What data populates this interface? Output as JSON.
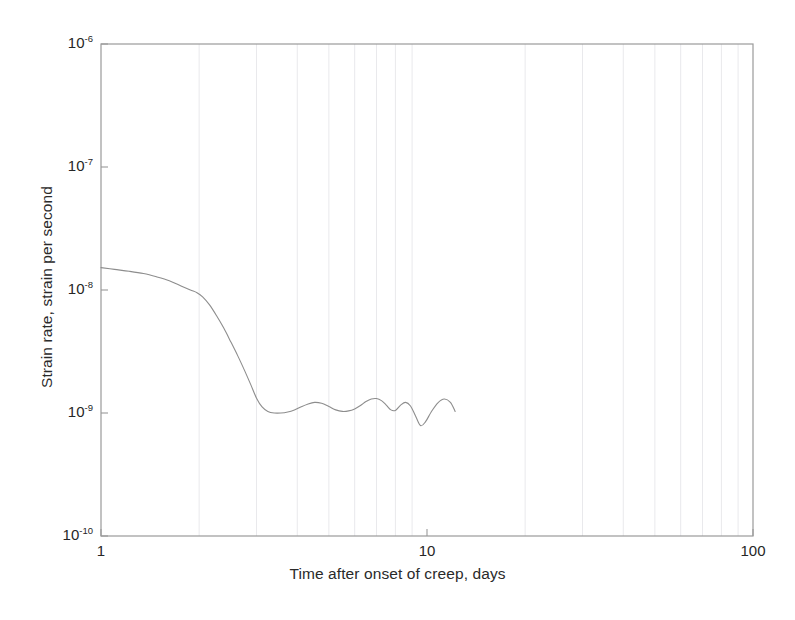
{
  "chart_data": {
    "type": "line",
    "title": "",
    "xlabel": "Time after onset of creep, days",
    "ylabel": "Strain rate, strain per second",
    "xscale": "log",
    "yscale": "log",
    "xlim": [
      1,
      100
    ],
    "ylim": [
      1e-10,
      1e-06
    ],
    "grid": true,
    "grid_axis": "x-minor",
    "legend": "none",
    "xticks": [
      {
        "value": 1,
        "label": "1"
      },
      {
        "value": 10,
        "label": "10"
      },
      {
        "value": 100,
        "label": "100"
      }
    ],
    "yticks": [
      {
        "value": 1e-06,
        "mantissa": "10",
        "exponent": "-6"
      },
      {
        "value": 1e-07,
        "mantissa": "10",
        "exponent": "-7"
      },
      {
        "value": 1e-08,
        "mantissa": "10",
        "exponent": "-8"
      },
      {
        "value": 1e-09,
        "mantissa": "10",
        "exponent": "-9"
      },
      {
        "value": 1e-10,
        "mantissa": "10",
        "exponent": "-10"
      }
    ],
    "series": [
      {
        "name": "strain rate",
        "color": "#8d8d8d",
        "linewidth": 1.1,
        "x": [
          1.0,
          1.1,
          1.22,
          1.35,
          1.48,
          1.62,
          1.76,
          1.88,
          1.97,
          2.05,
          2.15,
          2.26,
          2.38,
          2.5,
          2.63,
          2.76,
          2.88,
          3.0,
          3.12,
          3.25,
          3.4,
          3.56,
          3.74,
          3.92,
          4.1,
          4.3,
          4.52,
          4.75,
          5.0,
          5.25,
          5.5,
          5.75,
          6.0,
          6.25,
          6.5,
          6.75,
          7.0,
          7.25,
          7.5,
          7.75,
          8.0,
          8.3,
          8.6,
          8.9,
          9.2,
          9.55,
          9.9,
          10.3,
          10.8,
          11.3,
          11.8,
          12.2
        ],
        "y": [
          1.52e-08,
          1.47e-08,
          1.42e-08,
          1.36e-08,
          1.28e-08,
          1.19e-08,
          1.08e-08,
          1e-08,
          9.5e-09,
          8.8e-09,
          7.6e-09,
          6.2e-09,
          4.9e-09,
          3.8e-09,
          2.9e-09,
          2.2e-09,
          1.7e-09,
          1.32e-09,
          1.12e-09,
          1.03e-09,
          1e-09,
          1e-09,
          1.02e-09,
          1.06e-09,
          1.12e-09,
          1.18e-09,
          1.22e-09,
          1.2e-09,
          1.13e-09,
          1.06e-09,
          1.03e-09,
          1.04e-09,
          1.08e-09,
          1.15e-09,
          1.24e-09,
          1.3e-09,
          1.31e-09,
          1.26e-09,
          1.16e-09,
          1.06e-09,
          1.05e-09,
          1.16e-09,
          1.22e-09,
          1.14e-09,
          9.6e-10,
          7.9e-10,
          8.5e-10,
          1.02e-09,
          1.21e-09,
          1.3e-09,
          1.22e-09,
          1.03e-09
        ]
      }
    ],
    "style": {
      "axis_color": "#9a9a9a",
      "grid_color": "#e9e9ec",
      "text_color": "#262626",
      "background": "#ffffff"
    }
  }
}
